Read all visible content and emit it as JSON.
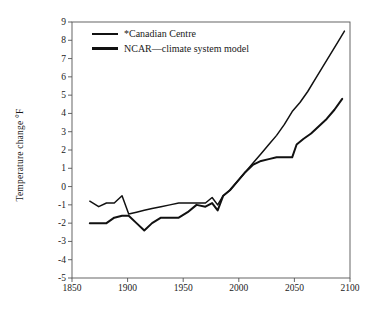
{
  "chart_data": {
    "type": "line",
    "title": "",
    "xlabel": "",
    "ylabel": "Temperature change °F",
    "xlim": [
      1850,
      2100
    ],
    "ylim": [
      -5,
      9
    ],
    "grid": false,
    "legend_position": "top-left",
    "xticks": [
      1850,
      1900,
      1950,
      2000,
      2050,
      2100
    ],
    "yticks": [
      -5,
      -4,
      -3,
      -2,
      -1,
      0,
      1,
      2,
      3,
      4,
      5,
      6,
      7,
      8,
      9
    ],
    "ytick_labels": [
      "-5",
      "-4",
      "-3",
      "-2",
      "-1",
      "0",
      "1",
      "2",
      "3",
      "4",
      "5",
      "6",
      "7",
      "8",
      "9"
    ],
    "xtick_labels": [
      "1850",
      "1900",
      "1950",
      "2000",
      "2050",
      "2100"
    ],
    "series": [
      {
        "name": "*Canadian Centre",
        "color": "#111111",
        "x": [
          1866,
          1874,
          1881,
          1888,
          1895,
          1901,
          1908,
          1915,
          1922,
          1930,
          1938,
          1946,
          1954,
          1962,
          1970,
          1976,
          1981,
          1986,
          1992,
          1999,
          2006,
          2013,
          2020,
          2027,
          2034,
          2041,
          2048,
          2055,
          2062,
          2069,
          2076,
          2083,
          2090,
          2095
        ],
        "y": [
          -0.8,
          -1.1,
          -0.9,
          -0.9,
          -0.5,
          -1.5,
          -1.4,
          -1.3,
          -1.2,
          -1.1,
          -1.0,
          -0.9,
          -0.9,
          -0.9,
          -0.9,
          -0.6,
          -1.0,
          -0.5,
          -0.2,
          0.3,
          0.8,
          1.3,
          1.8,
          2.3,
          2.8,
          3.4,
          4.1,
          4.6,
          5.2,
          5.9,
          6.6,
          7.3,
          8.0,
          8.5
        ]
      },
      {
        "name": "NCAR—climate system model",
        "color": "#111111",
        "x": [
          1866,
          1874,
          1881,
          1888,
          1895,
          1901,
          1908,
          1915,
          1922,
          1930,
          1938,
          1946,
          1954,
          1962,
          1970,
          1976,
          1981,
          1986,
          1992,
          1999,
          2006,
          2013,
          2020,
          2027,
          2034,
          2041,
          2048,
          2052,
          2058,
          2065,
          2072,
          2079,
          2086,
          2093
        ],
        "y": [
          -2.0,
          -2.0,
          -2.0,
          -1.7,
          -1.6,
          -1.6,
          -2.0,
          -2.4,
          -2.0,
          -1.7,
          -1.7,
          -1.7,
          -1.4,
          -1.0,
          -1.1,
          -0.9,
          -1.3,
          -0.5,
          -0.2,
          0.3,
          0.8,
          1.2,
          1.4,
          1.5,
          1.6,
          1.6,
          1.6,
          2.3,
          2.6,
          2.9,
          3.3,
          3.7,
          4.2,
          4.8
        ]
      }
    ]
  },
  "legend": {
    "entries": [
      {
        "label": "*Canadian Centre"
      },
      {
        "label": "NCAR—climate system model"
      }
    ]
  }
}
